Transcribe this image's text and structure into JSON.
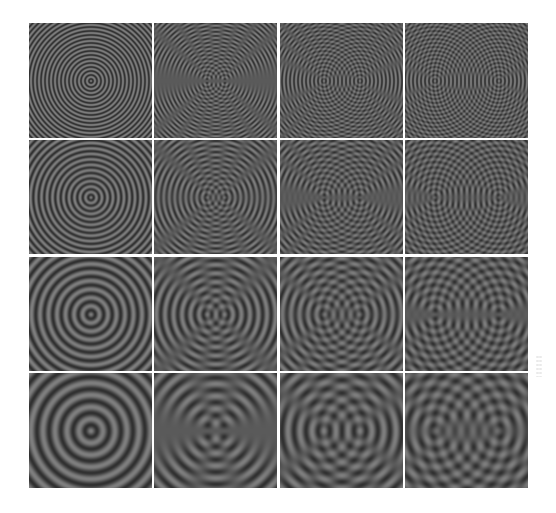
{
  "figure": {
    "rows": 4,
    "cols": 4,
    "colors": {
      "background": "#ffffff",
      "dark": "#303030",
      "light": "#7e7e7e",
      "separator": "#ffffff"
    },
    "row_params": [
      {
        "label": "wavelength-1",
        "wavelength_px": 4.0
      },
      {
        "label": "wavelength-2",
        "wavelength_px": 5.5
      },
      {
        "label": "wavelength-3",
        "wavelength_px": 8.5
      },
      {
        "label": "wavelength-4",
        "wavelength_px": 12.0
      }
    ],
    "col_params": [
      {
        "label": "separation-0",
        "source_separation_px": 0
      },
      {
        "label": "separation-1",
        "source_separation_px": 18
      },
      {
        "label": "separation-2",
        "source_separation_px": 36
      },
      {
        "label": "separation-3",
        "source_separation_px": 64
      }
    ],
    "panels": [
      {
        "row": 0,
        "col": 0,
        "pattern": "concentric-rings"
      },
      {
        "row": 0,
        "col": 1,
        "pattern": "two-source-hyperbolic-fringes"
      },
      {
        "row": 0,
        "col": 2,
        "pattern": "two-source-hyperbolic-fringes"
      },
      {
        "row": 0,
        "col": 3,
        "pattern": "two-source-hyperbolic-fringes"
      },
      {
        "row": 1,
        "col": 0,
        "pattern": "concentric-rings"
      },
      {
        "row": 1,
        "col": 1,
        "pattern": "two-source-hyperbolic-fringes"
      },
      {
        "row": 1,
        "col": 2,
        "pattern": "two-source-hyperbolic-fringes"
      },
      {
        "row": 1,
        "col": 3,
        "pattern": "two-source-hyperbolic-fringes"
      },
      {
        "row": 2,
        "col": 0,
        "pattern": "concentric-rings"
      },
      {
        "row": 2,
        "col": 1,
        "pattern": "two-source-hyperbolic-fringes"
      },
      {
        "row": 2,
        "col": 2,
        "pattern": "two-source-hyperbolic-fringes"
      },
      {
        "row": 2,
        "col": 3,
        "pattern": "two-source-hyperbolic-fringes"
      },
      {
        "row": 3,
        "col": 0,
        "pattern": "concentric-rings"
      },
      {
        "row": 3,
        "col": 1,
        "pattern": "two-source-hyperbolic-fringes"
      },
      {
        "row": 3,
        "col": 2,
        "pattern": "two-source-hyperbolic-fringes"
      },
      {
        "row": 3,
        "col": 3,
        "pattern": "two-source-hyperbolic-fringes"
      }
    ]
  }
}
